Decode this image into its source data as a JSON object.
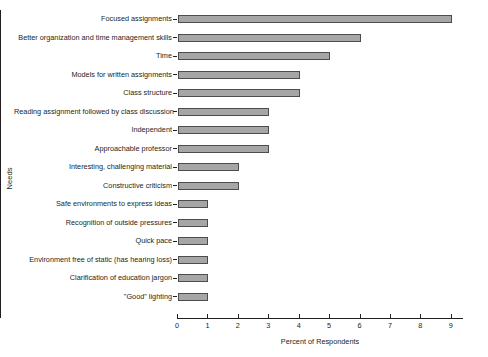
{
  "chart_data": {
    "type": "bar",
    "orientation": "horizontal",
    "title": "",
    "xlabel": "Percent of Respondents",
    "ylabel": "Needs",
    "xlim": [
      0,
      9.4
    ],
    "xticks": [
      0,
      1,
      2,
      3,
      4,
      5,
      6,
      7,
      8,
      9
    ],
    "grid": false,
    "legend": null,
    "bar_color": "#a6a6a6",
    "bar_edge_color": "#4d4d4d",
    "categories": [
      "Focused assignments",
      "Better organization and time management skills",
      "Time",
      "Models for written assignments",
      "Class structure",
      "Reading assignment followed by class discussion",
      "Independent",
      "Approachable professor",
      "Interesting, challenging material",
      "Constructive criticism",
      "Safe environments to express ideas",
      "Recognition of outside pressures",
      "Quick pace",
      "Environment free of static (has hearing loss)",
      "Clarification of education jargon",
      "\"Good\" lighting"
    ],
    "values": [
      9,
      6,
      5,
      4,
      4,
      3,
      3,
      3,
      2,
      2,
      1,
      1,
      1,
      1,
      1,
      1
    ]
  }
}
